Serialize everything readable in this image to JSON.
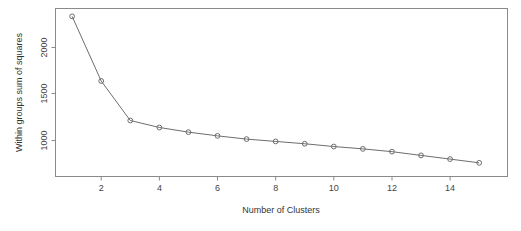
{
  "chart_data": {
    "type": "line",
    "title": "",
    "xlabel": "Number of Clusters",
    "ylabel": "Within groups sum of squares",
    "x": [
      1,
      2,
      3,
      4,
      5,
      6,
      7,
      8,
      9,
      10,
      11,
      12,
      13,
      14,
      15
    ],
    "values": [
      2335,
      1640,
      1215,
      1140,
      1090,
      1050,
      1015,
      990,
      965,
      935,
      910,
      880,
      840,
      800,
      760
    ],
    "xlim": [
      0.5,
      15.5
    ],
    "ylim": [
      700,
      2400
    ],
    "xticks": [
      2,
      4,
      6,
      8,
      10,
      12,
      14
    ],
    "xtick_labels": [
      "2",
      "4",
      "6",
      "8",
      "10",
      "12",
      "14"
    ],
    "yticks": [
      1000,
      1500,
      2000
    ],
    "ytick_labels": [
      "1000",
      "1500",
      "2000"
    ],
    "grid": false,
    "legend": null,
    "marker": "open-circle",
    "line_color": "#6e6e6e",
    "frame_color": "#8a8a8a",
    "background": "#ffffff"
  },
  "axes": {
    "x_title": "Number of Clusters",
    "y_title": "Within groups sum of squares"
  }
}
